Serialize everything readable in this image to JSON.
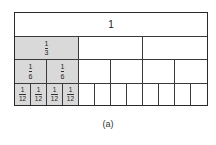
{
  "diagram": {
    "caption": "(a)",
    "colors": {
      "shaded": "#d9d9d9",
      "line": "#2a2a2a",
      "background": "#ffffff"
    },
    "rows": [
      {
        "name": "whole",
        "parts": 1,
        "shaded_count": 1,
        "label": "1",
        "shaded": false
      },
      {
        "name": "thirds",
        "parts": 3,
        "shaded_count": 1,
        "label": {
          "num": "1",
          "den": "3"
        }
      },
      {
        "name": "sixths",
        "parts": 6,
        "shaded_count": 2,
        "label": {
          "num": "1",
          "den": "6"
        }
      },
      {
        "name": "twelfths",
        "parts": 12,
        "shaded_count": 4,
        "label": {
          "num": "1",
          "den": "12"
        }
      }
    ]
  }
}
